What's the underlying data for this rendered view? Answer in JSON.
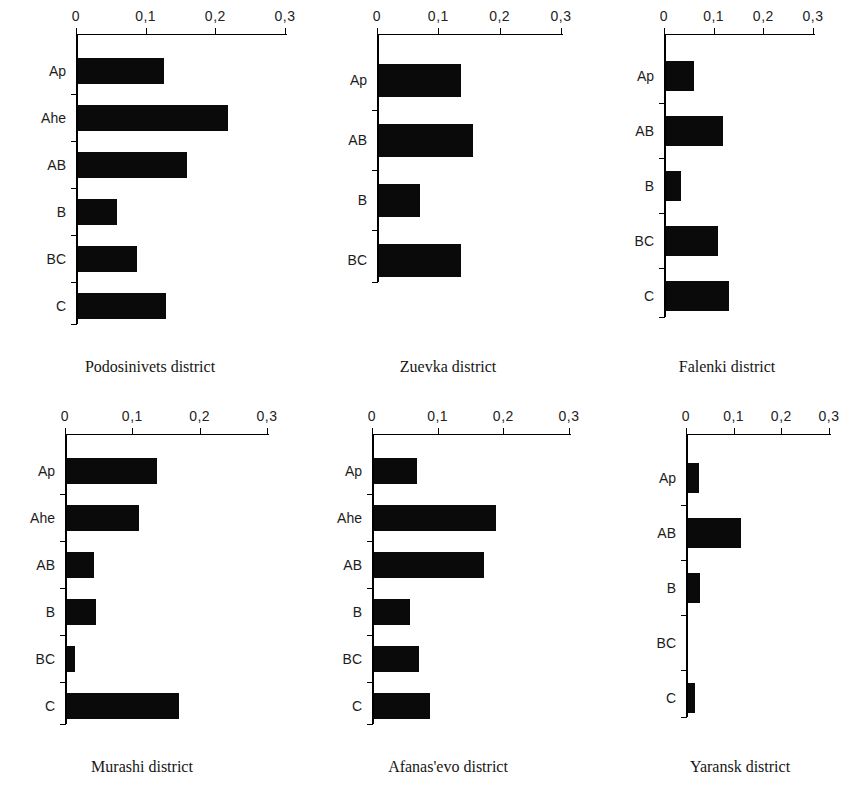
{
  "figure": {
    "axis_ticks": [
      "0",
      "0,1",
      "0,2",
      "0,3"
    ],
    "axis_tick_values": [
      0,
      0.1,
      0.2,
      0.3
    ],
    "xlim": [
      0,
      0.3
    ],
    "bar_color": "#0a0a0a",
    "axis_color": "#000000"
  },
  "panels": [
    {
      "caption": "Podosinivets district",
      "categories": [
        "Ap",
        "Ahe",
        "AB",
        "B",
        "BC",
        "C"
      ],
      "values": [
        0.123,
        0.216,
        0.157,
        0.056,
        0.085,
        0.126
      ]
    },
    {
      "caption": "Zuevka district",
      "categories": [
        "Ap",
        "AB",
        "B",
        "BC"
      ],
      "values": [
        0.134,
        0.154,
        0.067,
        0.134
      ]
    },
    {
      "caption": "Falenki district",
      "categories": [
        "Ap",
        "AB",
        "B",
        "BC",
        "C"
      ],
      "values": [
        0.057,
        0.115,
        0.03,
        0.105,
        0.127
      ]
    },
    {
      "caption": "Murashi district",
      "categories": [
        "Ap",
        "Ahe",
        "AB",
        "B",
        "BC",
        "C"
      ],
      "values": [
        0.133,
        0.107,
        0.04,
        0.043,
        0.012,
        0.166
      ]
    },
    {
      "caption": "Afanas'evo district",
      "categories": [
        "Ap",
        "Ahe",
        "AB",
        "B",
        "BC",
        "C"
      ],
      "values": [
        0.066,
        0.186,
        0.168,
        0.055,
        0.069,
        0.086
      ]
    },
    {
      "caption": "Yaransk district",
      "categories": [
        "Ap",
        "AB",
        "B",
        "BC",
        "C"
      ],
      "values": [
        0.023,
        0.111,
        0.025,
        0.0,
        0.015
      ]
    }
  ],
  "chart_data": {
    "type": "bar",
    "title": "",
    "xlabel": "",
    "ylabel": "",
    "xlim": [
      0,
      0.3
    ],
    "xticks": [
      0,
      0.1,
      0.2,
      0.3
    ],
    "xticklabels": [
      "0",
      "0,1",
      "0,2",
      "0,3"
    ],
    "grid": false,
    "legend": "none",
    "orientation": "horizontal",
    "panels": [
      {
        "title": "Podosinivets district",
        "categories": [
          "Ap",
          "Ahe",
          "AB",
          "B",
          "BC",
          "C"
        ],
        "values": [
          0.123,
          0.216,
          0.157,
          0.056,
          0.085,
          0.126
        ]
      },
      {
        "title": "Zuevka district",
        "categories": [
          "Ap",
          "AB",
          "B",
          "BC"
        ],
        "values": [
          0.134,
          0.154,
          0.067,
          0.134
        ]
      },
      {
        "title": "Falenki district",
        "categories": [
          "Ap",
          "AB",
          "B",
          "BC",
          "C"
        ],
        "values": [
          0.057,
          0.115,
          0.03,
          0.105,
          0.127
        ]
      },
      {
        "title": "Murashi district",
        "categories": [
          "Ap",
          "Ahe",
          "AB",
          "B",
          "BC",
          "C"
        ],
        "values": [
          0.133,
          0.107,
          0.04,
          0.043,
          0.012,
          0.166
        ]
      },
      {
        "title": "Afanas'evo district",
        "categories": [
          "Ap",
          "Ahe",
          "AB",
          "B",
          "BC",
          "C"
        ],
        "values": [
          0.066,
          0.186,
          0.168,
          0.055,
          0.069,
          0.086
        ]
      },
      {
        "title": "Yaransk district",
        "categories": [
          "Ap",
          "AB",
          "B",
          "BC",
          "C"
        ],
        "values": [
          0.023,
          0.111,
          0.025,
          0.0,
          0.015
        ]
      }
    ]
  }
}
